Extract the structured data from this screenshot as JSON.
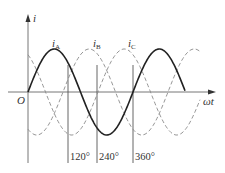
{
  "diagram": {
    "axes": {
      "y_label": "i",
      "x_label": "ωt",
      "origin_label": "O"
    },
    "curves": [
      {
        "name": "iA",
        "label_main": "i",
        "label_sub": "A",
        "style": "solid",
        "phase_deg": 0
      },
      {
        "name": "iB",
        "label_main": "i",
        "label_sub": "B",
        "style": "dashed",
        "phase_deg": -120
      },
      {
        "name": "iC",
        "label_main": "i",
        "label_sub": "C",
        "style": "dashed",
        "phase_deg": -240
      }
    ],
    "markers": [
      {
        "label": "120°"
      },
      {
        "label": "240°"
      },
      {
        "label": "360°"
      }
    ],
    "colors": {
      "solid": "#222222",
      "dashed": "#888888",
      "axis": "#555555"
    }
  }
}
